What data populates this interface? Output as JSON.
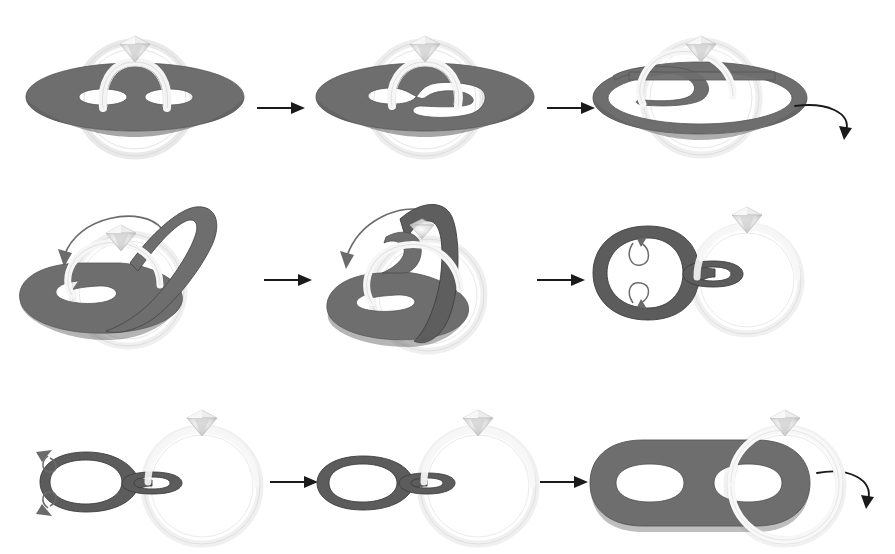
{
  "figure": {
    "domain": "diagram",
    "canvas": {
      "width": 895,
      "height": 554,
      "background": "#ffffff"
    },
    "palette": {
      "surface_fill": "#6e6e6e",
      "surface_fill_dark": "#5a5a5a",
      "surface_edge": "#4a4a4a",
      "ring_band": "#f2f2f2",
      "ring_outline": "#d8d8d8",
      "ring_shadow": "#e6e6e6",
      "diamond_light": "#f4f4f4",
      "diamond_mid": "#d9d9d9",
      "diamond_dark": "#b4b4b4",
      "arrow": "#1a1a1a",
      "rotation_arrow": "#5e5e5e"
    },
    "rows": [
      {
        "name": "row-1",
        "panels": [
          {
            "index": 1,
            "name": "panel-flat-disk-two-holes",
            "caption": "Flat disk with two holes; ring band passes up through both holes",
            "holes": 2,
            "hole_shape": "two separate ellipses",
            "ring_visible": true,
            "diamond_visible": true,
            "rotation_arrow": null
          },
          {
            "index": 2,
            "name": "panel-merged-s-hole",
            "caption": "The two holes merge into one S-shaped hole",
            "holes": 1,
            "hole_shape": "S-shaped merged hole",
            "ring_visible": true,
            "diamond_visible": true,
            "rotation_arrow": null
          },
          {
            "index": 3,
            "name": "panel-spiral-band",
            "caption": "Surface thins into a spiralling annular band",
            "holes": 1,
            "hole_shape": "spiral annulus",
            "ring_visible": true,
            "diamond_visible": true,
            "rotation_arrow": "clockwise-down-right"
          }
        ]
      },
      {
        "name": "row-2",
        "panels": [
          {
            "index": 4,
            "name": "panel-lifted-loop",
            "caption": "Right portion of the band lifts up and over",
            "holes": 1,
            "hole_shape": "spiral with raised loop",
            "ring_visible": true,
            "diamond_visible": true,
            "rotation_arrow": "curl-left-down"
          },
          {
            "index": 5,
            "name": "panel-folded-over",
            "caption": "Band folds further across the ring",
            "holes": 1,
            "hole_shape": "folded spiral",
            "ring_visible": true,
            "diamond_visible": true,
            "rotation_arrow": "curl-left-down"
          },
          {
            "index": 6,
            "name": "panel-ring-linked-loops",
            "caption": "Surface becomes a loop linked through the ring",
            "holes": 1,
            "hole_shape": "large loop joined to small loop",
            "ring_visible": true,
            "diamond_visible": true,
            "rotation_arrow": "clockwise-down-right",
            "twist_arrows": 2
          }
        ]
      },
      {
        "name": "row-3",
        "panels": [
          {
            "index": 7,
            "name": "panel-untwist",
            "caption": "The twisted edge untwists",
            "holes": 1,
            "hole_shape": "loop with twisted left edge",
            "ring_visible": true,
            "diamond_visible": true,
            "rotation_arrow": null,
            "twist_arrows": 2
          },
          {
            "index": 8,
            "name": "panel-two-clean-loops",
            "caption": "Two clean annuli joined, small one through the ring",
            "holes": 2,
            "hole_shape": "two joined annuli",
            "ring_visible": true,
            "diamond_visible": true,
            "rotation_arrow": null
          },
          {
            "index": 9,
            "name": "panel-final-two-holed-surface",
            "caption": "Final two-holed surface with ring through the right hole",
            "holes": 2,
            "hole_shape": "two ellipse holes in a rounded slab",
            "ring_visible": true,
            "diamond_visible": true,
            "rotation_arrow": null
          }
        ]
      }
    ],
    "arrows": [
      {
        "name": "arrow-1-2",
        "kind": "straight-right",
        "row": 1,
        "after_panel": 1
      },
      {
        "name": "arrow-2-3",
        "kind": "straight-right",
        "row": 1,
        "after_panel": 2
      },
      {
        "name": "arrow-3-4",
        "kind": "curved-rotate",
        "row": 1,
        "after_panel": 3
      },
      {
        "name": "arrow-4-5",
        "kind": "straight-right",
        "row": 2,
        "after_panel": 4
      },
      {
        "name": "arrow-5-6",
        "kind": "straight-right",
        "row": 2,
        "after_panel": 5
      },
      {
        "name": "arrow-6-7",
        "kind": "curved-rotate",
        "row": 2,
        "after_panel": 6
      },
      {
        "name": "arrow-7-8",
        "kind": "straight-right",
        "row": 3,
        "after_panel": 7
      },
      {
        "name": "arrow-8-9",
        "kind": "straight-right",
        "row": 3,
        "after_panel": 8
      }
    ]
  }
}
